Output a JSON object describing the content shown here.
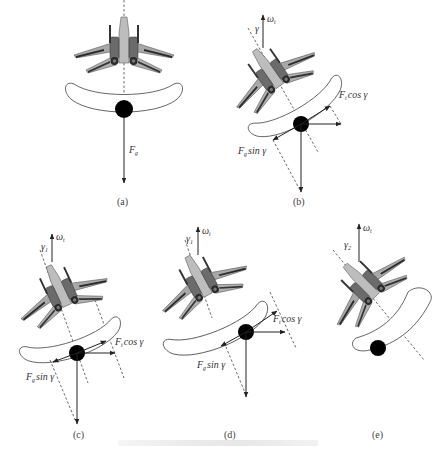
{
  "figure": {
    "panels": [
      {
        "id": "a",
        "label": "(a)",
        "force_label": "F",
        "force_sub": "g"
      },
      {
        "id": "b",
        "label": "(b)",
        "omega": "ω",
        "omega_sub": "t",
        "angle": "γ",
        "comp_cos": "F",
        "comp_cos_sub": "t",
        "comp_cos_tail": "cos γ",
        "comp_sin": "F",
        "comp_sin_sub": "g",
        "comp_sin_tail": "sin γ"
      },
      {
        "id": "c",
        "label": "(c)",
        "omega": "ω",
        "omega_sub": "t",
        "angle": "γ",
        "angle_sub": "1",
        "comp_cos": "F",
        "comp_cos_sub": "t",
        "comp_cos_tail": "cos γ",
        "comp_sin": "F",
        "comp_sin_sub": "g",
        "comp_sin_tail": "sin γ"
      },
      {
        "id": "d",
        "label": "(d)",
        "omega": "ω",
        "omega_sub": "t",
        "angle": "γ",
        "angle_sub": "1",
        "comp_cos": "F",
        "comp_cos_sub": "t",
        "comp_cos_tail": "cos γ",
        "comp_sin": "F",
        "comp_sin_sub": "g",
        "comp_sin_tail": "sin γ"
      },
      {
        "id": "e",
        "label": "(e)",
        "omega": "ω",
        "omega_sub": "t",
        "angle": "γ",
        "angle_sub": "2"
      }
    ],
    "colors": {
      "aircraft_body": "#9a9a9a",
      "aircraft_dark": "#3a3a3a",
      "aircraft_light": "#c8c8c8",
      "ball": "#000000",
      "lines": "#222222"
    }
  }
}
